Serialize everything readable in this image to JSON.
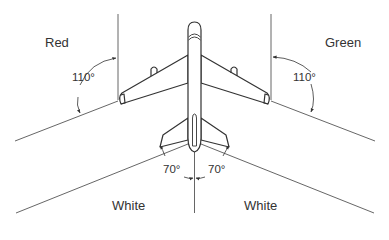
{
  "diagram": {
    "sectors": [
      {
        "id": "red",
        "label": "Red",
        "angle": "110°",
        "side": "left wing"
      },
      {
        "id": "green",
        "label": "Green",
        "angle": "110°",
        "side": "right wing"
      },
      {
        "id": "white-left",
        "label": "White",
        "angle": "70°",
        "side": "tail left"
      },
      {
        "id": "white-right",
        "label": "White",
        "angle": "70°",
        "side": "tail right"
      }
    ],
    "colors": {
      "line": "#3a3a3a",
      "text": "#333333",
      "background": "#ffffff"
    }
  }
}
